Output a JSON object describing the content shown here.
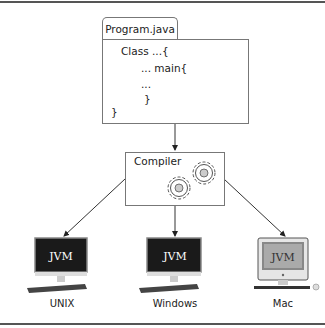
{
  "diagram": {
    "source_file": {
      "tab_label": "Program.java",
      "code_lines": [
        "Class ...{",
        "... main{",
        "...",
        "}",
        "}"
      ]
    },
    "compiler": {
      "label": "Compiler"
    },
    "targets": [
      {
        "label": "UNIX",
        "screen_text": "JVM"
      },
      {
        "label": "Windows",
        "screen_text": "JVM"
      },
      {
        "label": "Mac",
        "screen_text": "JVM"
      }
    ]
  }
}
